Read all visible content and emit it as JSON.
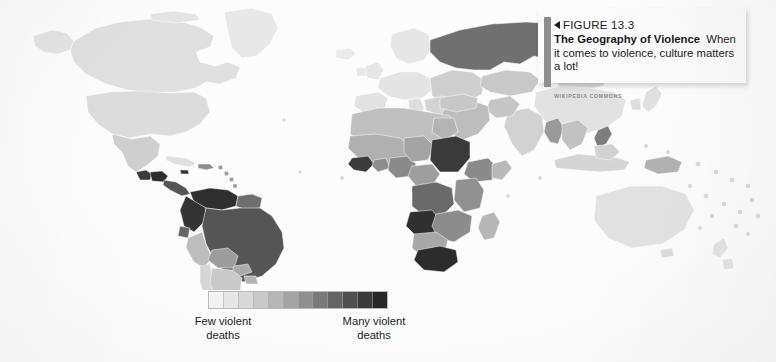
{
  "figure": {
    "number_label": "FIGURE 13.3",
    "title": "The Geography of Violence",
    "body": "When it comes to violence, culture matters a lot!",
    "credit": "WIKIPEDIA COMMONS"
  },
  "legend": {
    "low_label": "Few violent deaths",
    "high_label": "Many violent deaths",
    "swatch_colors": [
      "#f2f2f2",
      "#e6e6e6",
      "#d9d9d9",
      "#c9c9c9",
      "#b6b6b6",
      "#a3a3a3",
      "#8f8f8f",
      "#7a7a7a",
      "#656565",
      "#4f4f4f",
      "#3a3a3a",
      "#272727"
    ]
  },
  "map": {
    "type": "choropleth",
    "variable": "violent deaths per capita",
    "background": "#fcfcfc",
    "ocean_color": "#fcfcfc",
    "shades": {
      "lightest": "#efefef",
      "light": "#e4e4e4",
      "light_mid": "#d8d8d8",
      "mid": "#c3c3c3",
      "mid_dark": "#a8a8a8",
      "dark": "#8b8b8b",
      "darker": "#6f6f6f",
      "darkest": "#3f3f3f",
      "near_black": "#2b2b2b"
    },
    "regions": [
      {
        "name": "Greenland",
        "shade": "#e8e8e8"
      },
      {
        "name": "Canada",
        "shade": "#e0e0e0"
      },
      {
        "name": "United States",
        "shade": "#dcdcdc"
      },
      {
        "name": "Alaska",
        "shade": "#e3e3e3"
      },
      {
        "name": "Mexico",
        "shade": "#cfcfcf"
      },
      {
        "name": "Guatemala",
        "shade": "#3a3a3a"
      },
      {
        "name": "Honduras",
        "shade": "#2d2d2d"
      },
      {
        "name": "El Salvador",
        "shade": "#2d2d2d"
      },
      {
        "name": "Cuba",
        "shade": "#e0e0e0"
      },
      {
        "name": "Jamaica",
        "shade": "#333333"
      },
      {
        "name": "Haiti / Dominican Republic",
        "shade": "#8f8f8f"
      },
      {
        "name": "Venezuela",
        "shade": "#2f2f2f"
      },
      {
        "name": "Colombia",
        "shade": "#343434"
      },
      {
        "name": "Brazil",
        "shade": "#555555"
      },
      {
        "name": "Peru",
        "shade": "#bdbdbd"
      },
      {
        "name": "Bolivia",
        "shade": "#9d9d9d"
      },
      {
        "name": "Chile",
        "shade": "#d6d6d6"
      },
      {
        "name": "Argentina",
        "shade": "#cacaca"
      },
      {
        "name": "Western Europe",
        "shade": "#e6e6e6"
      },
      {
        "name": "Eastern Europe",
        "shade": "#cfcfcf"
      },
      {
        "name": "Russia",
        "shade": "#707070"
      },
      {
        "name": "North Africa",
        "shade": "#c0c0c0"
      },
      {
        "name": "Nigeria",
        "shade": "#8a8a8a"
      },
      {
        "name": "Ivory Coast",
        "shade": "#3b3b3b"
      },
      {
        "name": "Sudan",
        "shade": "#3a3a3a"
      },
      {
        "name": "Ethiopia",
        "shade": "#8a8a8a"
      },
      {
        "name": "DR Congo",
        "shade": "#6a6a6a"
      },
      {
        "name": "Angola",
        "shade": "#303030"
      },
      {
        "name": "South Africa",
        "shade": "#2c2c2c"
      },
      {
        "name": "Middle East",
        "shade": "#bdbdbd"
      },
      {
        "name": "India",
        "shade": "#d2d2d2"
      },
      {
        "name": "China",
        "shade": "#e2e2e2"
      },
      {
        "name": "Myanmar",
        "shade": "#9a9a9a"
      },
      {
        "name": "Philippines",
        "shade": "#7d7d7d"
      },
      {
        "name": "Indonesia",
        "shade": "#d5d5d5"
      },
      {
        "name": "Papua New Guinea",
        "shade": "#b2b2b2"
      },
      {
        "name": "Australia",
        "shade": "#e2e2e2"
      },
      {
        "name": "New Zealand",
        "shade": "#e4e4e4"
      }
    ]
  }
}
